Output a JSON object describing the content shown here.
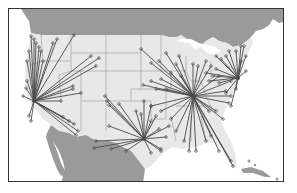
{
  "map": {
    "title": "",
    "type": "flow-map",
    "region": "United States",
    "colors": {
      "ocean": "#ffffff",
      "us_land": "#e8e8e8",
      "foreign_land": "#9a9a9a",
      "state_borders": "#888888",
      "routes": "#4a4a4a",
      "frame": "#333333"
    },
    "hubs": [
      {
        "name": "west-coast-hub",
        "x": 33,
        "y": 100,
        "targets": [
          [
            30,
            35
          ],
          [
            33,
            38
          ],
          [
            35,
            42
          ],
          [
            38,
            46
          ],
          [
            40,
            50
          ],
          [
            42,
            60
          ],
          [
            52,
            42
          ],
          [
            56,
            38
          ],
          [
            73,
            34
          ],
          [
            90,
            55
          ],
          [
            98,
            57
          ],
          [
            95,
            65
          ],
          [
            72,
            88
          ],
          [
            80,
            92
          ],
          [
            72,
            85
          ],
          [
            60,
            100
          ],
          [
            68,
            120
          ],
          [
            73,
            123
          ],
          [
            77,
            130
          ],
          [
            75,
            134
          ],
          [
            62,
            116
          ],
          [
            25,
            87
          ],
          [
            22,
            95
          ],
          [
            28,
            115
          ],
          [
            30,
            120
          ],
          [
            26,
            80
          ],
          [
            26,
            60
          ],
          [
            28,
            50
          ]
        ]
      },
      {
        "name": "south-central-hub",
        "x": 143,
        "y": 138,
        "targets": [
          [
            104,
            95
          ],
          [
            106,
            100
          ],
          [
            108,
            104
          ],
          [
            118,
            103
          ],
          [
            135,
            110
          ],
          [
            140,
            113
          ],
          [
            108,
            125
          ],
          [
            95,
            140
          ],
          [
            93,
            147
          ],
          [
            110,
            148
          ],
          [
            125,
            150
          ],
          [
            150,
            120
          ],
          [
            155,
            115
          ],
          [
            168,
            125
          ],
          [
            160,
            148
          ],
          [
            150,
            152
          ],
          [
            160,
            150
          ],
          [
            165,
            136
          ],
          [
            158,
            128
          ],
          [
            150,
            105
          ],
          [
            143,
            100
          ]
        ]
      },
      {
        "name": "central-east-hub",
        "x": 192,
        "y": 95,
        "targets": [
          [
            140,
            48
          ],
          [
            150,
            62
          ],
          [
            158,
            60
          ],
          [
            165,
            52
          ],
          [
            178,
            55
          ],
          [
            175,
            63
          ],
          [
            170,
            72
          ],
          [
            150,
            80
          ],
          [
            142,
            84
          ],
          [
            155,
            88
          ],
          [
            165,
            88
          ],
          [
            160,
            78
          ],
          [
            180,
            75
          ],
          [
            192,
            63
          ],
          [
            197,
            65
          ],
          [
            205,
            60
          ],
          [
            210,
            65
          ],
          [
            218,
            75
          ],
          [
            230,
            80
          ],
          [
            225,
            90
          ],
          [
            230,
            95
          ],
          [
            228,
            102
          ],
          [
            215,
            110
          ],
          [
            208,
            110
          ],
          [
            222,
            118
          ],
          [
            210,
            135
          ],
          [
            230,
            160
          ],
          [
            232,
            165
          ],
          [
            218,
            150
          ],
          [
            205,
            140
          ],
          [
            195,
            150
          ],
          [
            188,
            150
          ],
          [
            183,
            140
          ],
          [
            175,
            130
          ],
          [
            170,
            118
          ],
          [
            160,
            110
          ],
          [
            150,
            105
          ]
        ]
      },
      {
        "name": "east-coast-hub",
        "x": 237,
        "y": 77,
        "targets": [
          [
            215,
            55
          ],
          [
            220,
            58
          ],
          [
            225,
            55
          ],
          [
            228,
            50
          ],
          [
            235,
            50
          ],
          [
            240,
            45
          ],
          [
            243,
            45
          ],
          [
            245,
            55
          ],
          [
            215,
            68
          ],
          [
            212,
            75
          ],
          [
            218,
            82
          ],
          [
            225,
            92
          ],
          [
            230,
            105
          ],
          [
            235,
            88
          ],
          [
            245,
            70
          ],
          [
            240,
            60
          ],
          [
            205,
            72
          ],
          [
            208,
            80
          ]
        ]
      }
    ]
  }
}
